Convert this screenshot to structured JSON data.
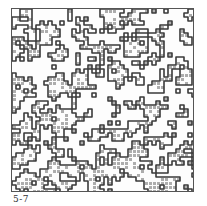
{
  "figure": {
    "label": "5-7",
    "colors": {
      "frame": "#555555",
      "cluster_outline": "#3a3a3a",
      "cluster_fill": "#8a8a8a",
      "background": "#fdfdfd"
    },
    "grid": {
      "cols": 46,
      "rows": 46,
      "cell_px": 4,
      "occupancy": 0.44,
      "seed": 57
    }
  }
}
